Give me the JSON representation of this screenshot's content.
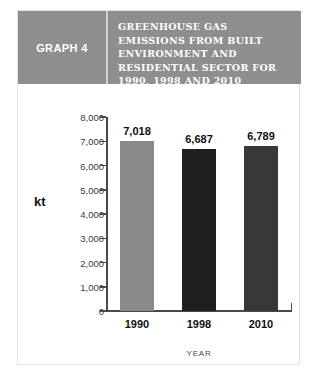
{
  "header": {
    "graph_label": "GRAPH 4",
    "title": "GREENHOUSE GAS EMISSIONS FROM BUILT ENVIRONMENT AND RESIDENTIAL SECTOR FOR 1990, 1998 AND 2010 PROJECTIONS"
  },
  "colors": {
    "header_band": "#8e8e8e",
    "bar_1990": "#8a8a8a",
    "bar_1998": "#1e1e1e",
    "bar_2010": "#383838",
    "axis": "#4a4a4a",
    "card_border": "#e2e2e2"
  },
  "chart_data": {
    "type": "bar",
    "title": "GREENHOUSE GAS EMISSIONS FROM BUILT ENVIRONMENT AND RESIDENTIAL SECTOR FOR 1990, 1998 AND 2010 PROJECTIONS",
    "categories": [
      "1990",
      "1998",
      "2010"
    ],
    "values": [
      7018,
      6687,
      6789
    ],
    "value_labels": [
      "7,018",
      "6,687",
      "6,789"
    ],
    "bar_colors": [
      "#8a8a8a",
      "#1e1e1e",
      "#383838"
    ],
    "xlabel": "YEAR",
    "ylabel": "kt",
    "ylim": [
      0,
      8000
    ],
    "ytick_step": 1000,
    "ytick_labels": [
      "8,000",
      "7,000",
      "6,000",
      "5,000",
      "4,000",
      "3,000",
      "2,000",
      "1,000",
      "0"
    ],
    "ytick_values": [
      8000,
      7000,
      6000,
      5000,
      4000,
      3000,
      2000,
      1000,
      0
    ],
    "grid": false,
    "legend": "none"
  }
}
